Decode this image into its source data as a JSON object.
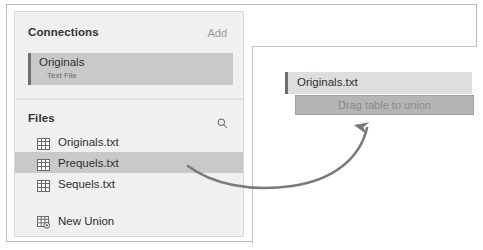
{
  "sidebar": {
    "connections": {
      "title": "Connections",
      "add_label": "Add",
      "card": {
        "name": "Originals",
        "type": "Text File"
      }
    },
    "files": {
      "title": "Files",
      "search_icon": "search-icon",
      "items": [
        {
          "label": "Originals.txt",
          "icon": "table-icon",
          "selected": false
        },
        {
          "label": "Prequels.txt",
          "icon": "table-icon",
          "selected": true
        },
        {
          "label": "Sequels.txt",
          "icon": "table-icon",
          "selected": false
        }
      ],
      "new_union": {
        "label": "New Union",
        "icon": "new-union-icon"
      }
    }
  },
  "canvas": {
    "table_card": {
      "label": "Originals.txt"
    },
    "drop_zone": {
      "label": "Drag table to union"
    },
    "annotation": {
      "icon": "curved-arrow-icon"
    }
  },
  "colors": {
    "sidebar_bg": "#f0f0f0",
    "selected_row": "#c9c9c9",
    "accent_bar": "#6e6e6e",
    "drop_zone_bg": "#b5b5b5",
    "drop_zone_text": "#8a8a8a",
    "arrow": "#7a7a7a",
    "table_card_bg": "#dedede"
  }
}
